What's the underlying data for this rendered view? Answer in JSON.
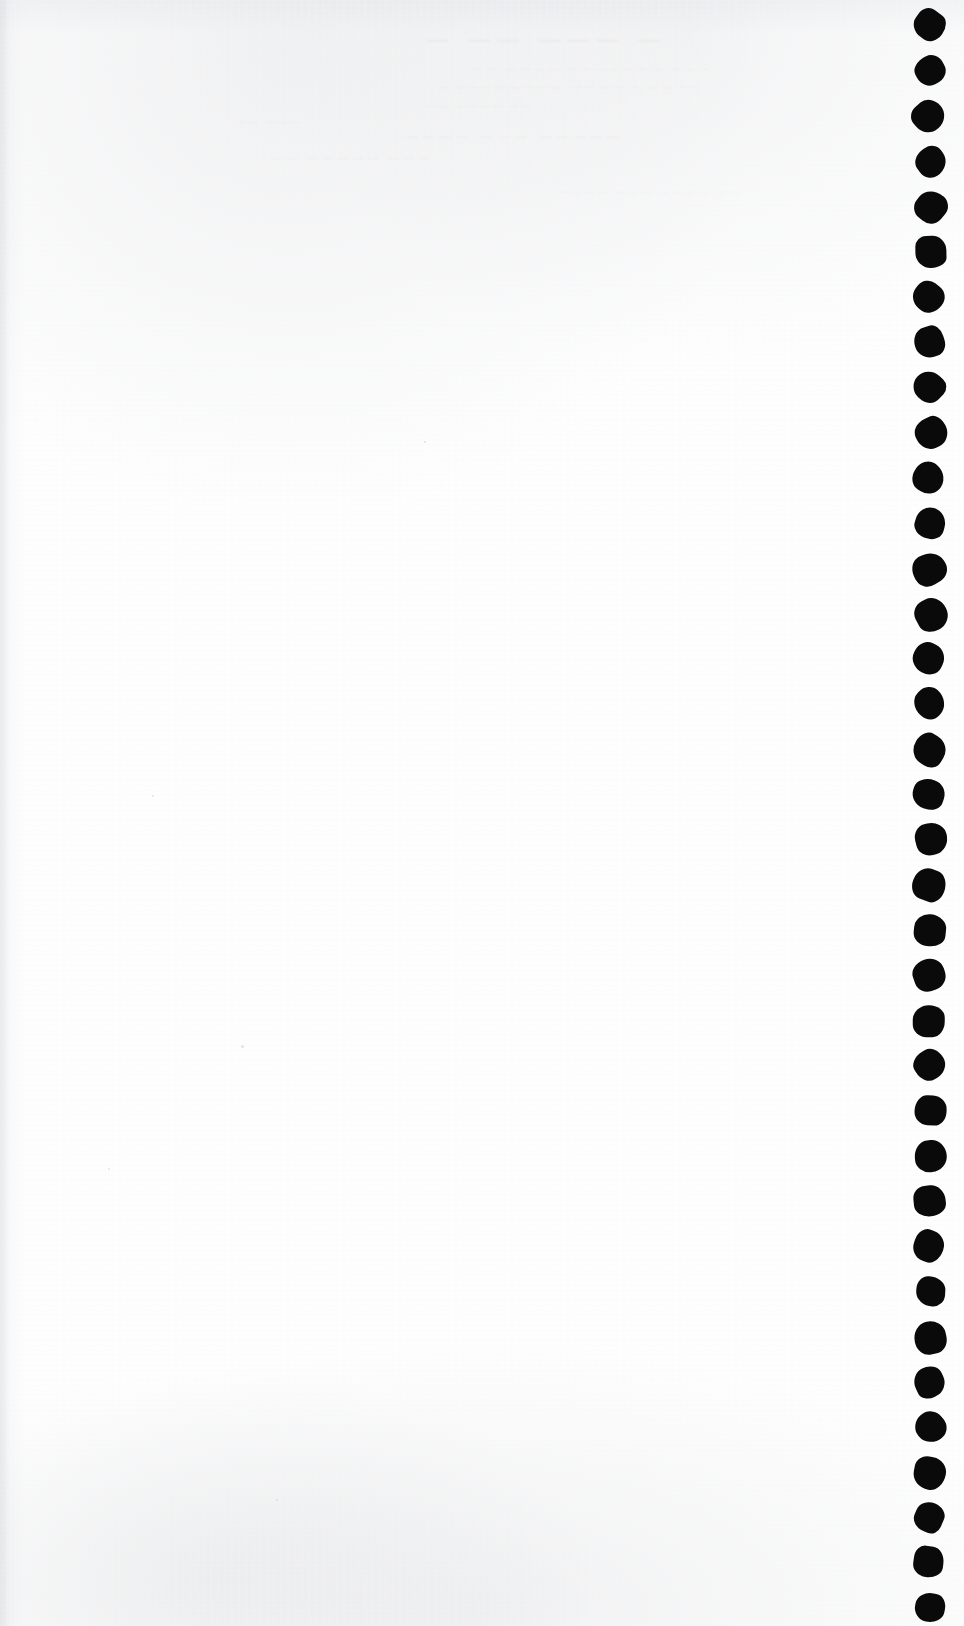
{
  "document": {
    "kind": "scanned-blank-page",
    "description": "Blank verso of a scanned printed page with punched binding holes along the right margin",
    "width": 964,
    "height": 1626,
    "page_color": "#fefefe",
    "hole_color": "#0a0a0a",
    "edge_shadow_color": "#c6c9ce",
    "visible_text": "",
    "body_text": ""
  },
  "punch_holes": {
    "name": "binding-punch-holes",
    "count": 36,
    "diameter_px": 31,
    "center_x_px": 930,
    "first_center_y_px": 26,
    "spacing_px": 45.2,
    "shape": "irregular-round",
    "edge": "right"
  },
  "bleed_through": {
    "note": "Extremely faint mirrored show-through from the printed recto; not legible",
    "opacity": 0.055,
    "lines": [
      "—  ———  ——  —",
      "———  ———————  ————  ——",
      "————  —————  —————————",
      "——  ————  ——",
      "—————  ———  ————",
      "———  —————  ——",
      "——  ————  ———  ————",
      "———  ——"
    ]
  },
  "specks": [
    {
      "x": 241,
      "y": 1045,
      "size": 3
    },
    {
      "x": 108,
      "y": 1168,
      "size": 2
    },
    {
      "x": 424,
      "y": 441,
      "size": 2
    },
    {
      "x": 152,
      "y": 795,
      "size": 2
    },
    {
      "x": 276,
      "y": 1499,
      "size": 2
    }
  ]
}
